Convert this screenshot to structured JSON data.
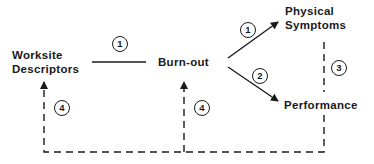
{
  "nodes": {
    "worksite_line1": "Worksite",
    "worksite_line2": "Descriptors",
    "burnout": "Burn-out",
    "physical_line1": "Physical",
    "physical_line2": "Symptoms",
    "performance": "Performance"
  },
  "paths": {
    "worksite_burnout": "1",
    "burnout_physical": "1",
    "burnout_performance": "2",
    "physical_performance": "3",
    "feedback_worksite": "4",
    "feedback_burnout": "4"
  },
  "colors": {
    "ink": "#1a1a1a",
    "background": "#ffffff"
  }
}
